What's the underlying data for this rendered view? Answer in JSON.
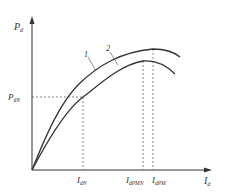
{
  "diagram": {
    "y_axis": {
      "label": "P",
      "label_sub": "d"
    },
    "x_axis": {
      "label": "I",
      "label_sub": "d"
    },
    "curves": [
      {
        "id": "1",
        "label": "1"
      },
      {
        "id": "2",
        "label": "2"
      }
    ],
    "y_marks": [
      {
        "label": "P",
        "label_sub": "dN"
      }
    ],
    "x_marks": [
      {
        "label": "I",
        "label_sub": "dN"
      },
      {
        "label": "I",
        "label_sub": "dPMN"
      },
      {
        "label": "I",
        "label_sub": "dPM"
      }
    ],
    "colors": {
      "line": "#333333",
      "dash": "#555555"
    }
  }
}
